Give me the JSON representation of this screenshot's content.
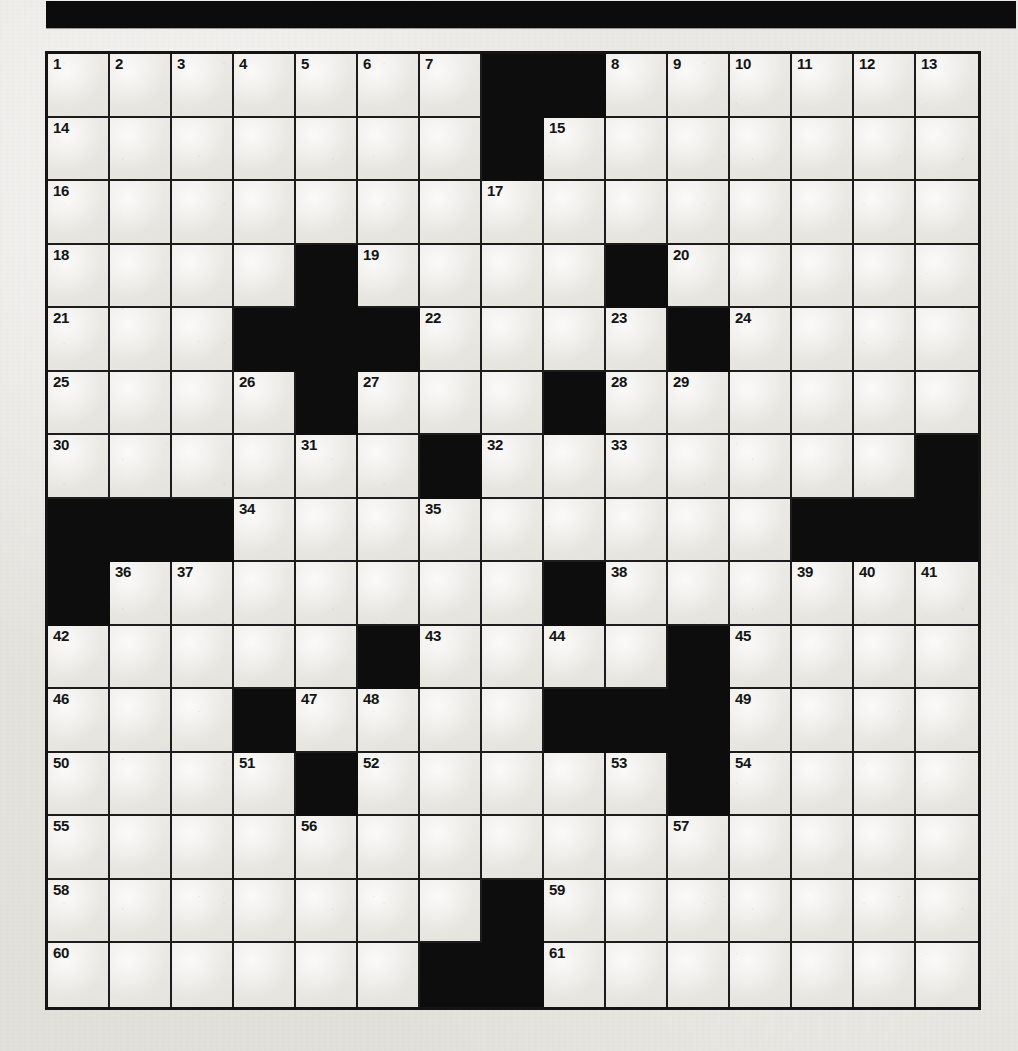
{
  "masthead": {
    "title": "",
    "color": "#0c0c0c"
  },
  "puzzle": {
    "name": "Crossword Puzzle",
    "rows": 15,
    "columns": 15,
    "cell_colors": {
      "white": "#eae8e3",
      "black": "#0d0d0d",
      "grid_line": "#1c1c1c",
      "number": "#141414"
    },
    "total_clue_numbers": 61,
    "grid": [
      [
        {
          "type": "white",
          "number": "1"
        },
        {
          "type": "white",
          "number": "2"
        },
        {
          "type": "white",
          "number": "3"
        },
        {
          "type": "white",
          "number": "4"
        },
        {
          "type": "white",
          "number": "5"
        },
        {
          "type": "white",
          "number": "6"
        },
        {
          "type": "white",
          "number": "7"
        },
        {
          "type": "black",
          "number": ""
        },
        {
          "type": "black",
          "number": ""
        },
        {
          "type": "white",
          "number": "8"
        },
        {
          "type": "white",
          "number": "9"
        },
        {
          "type": "white",
          "number": "10"
        },
        {
          "type": "white",
          "number": "11"
        },
        {
          "type": "white",
          "number": "12"
        },
        {
          "type": "white",
          "number": "13"
        }
      ],
      [
        {
          "type": "white",
          "number": "14"
        },
        {
          "type": "white",
          "number": ""
        },
        {
          "type": "white",
          "number": ""
        },
        {
          "type": "white",
          "number": ""
        },
        {
          "type": "white",
          "number": ""
        },
        {
          "type": "white",
          "number": ""
        },
        {
          "type": "white",
          "number": ""
        },
        {
          "type": "black",
          "number": ""
        },
        {
          "type": "white",
          "number": "15"
        },
        {
          "type": "white",
          "number": ""
        },
        {
          "type": "white",
          "number": ""
        },
        {
          "type": "white",
          "number": ""
        },
        {
          "type": "white",
          "number": ""
        },
        {
          "type": "white",
          "number": ""
        },
        {
          "type": "white",
          "number": ""
        }
      ],
      [
        {
          "type": "white",
          "number": "16"
        },
        {
          "type": "white",
          "number": ""
        },
        {
          "type": "white",
          "number": ""
        },
        {
          "type": "white",
          "number": ""
        },
        {
          "type": "white",
          "number": ""
        },
        {
          "type": "white",
          "number": ""
        },
        {
          "type": "white",
          "number": ""
        },
        {
          "type": "white",
          "number": "17"
        },
        {
          "type": "white",
          "number": ""
        },
        {
          "type": "white",
          "number": ""
        },
        {
          "type": "white",
          "number": ""
        },
        {
          "type": "white",
          "number": ""
        },
        {
          "type": "white",
          "number": ""
        },
        {
          "type": "white",
          "number": ""
        },
        {
          "type": "white",
          "number": ""
        }
      ],
      [
        {
          "type": "white",
          "number": "18"
        },
        {
          "type": "white",
          "number": ""
        },
        {
          "type": "white",
          "number": ""
        },
        {
          "type": "white",
          "number": ""
        },
        {
          "type": "black",
          "number": ""
        },
        {
          "type": "white",
          "number": "19"
        },
        {
          "type": "white",
          "number": ""
        },
        {
          "type": "white",
          "number": ""
        },
        {
          "type": "white",
          "number": ""
        },
        {
          "type": "black",
          "number": ""
        },
        {
          "type": "white",
          "number": "20"
        },
        {
          "type": "white",
          "number": ""
        },
        {
          "type": "white",
          "number": ""
        },
        {
          "type": "white",
          "number": ""
        },
        {
          "type": "white",
          "number": ""
        }
      ],
      [
        {
          "type": "white",
          "number": "21"
        },
        {
          "type": "white",
          "number": ""
        },
        {
          "type": "white",
          "number": ""
        },
        {
          "type": "black",
          "number": ""
        },
        {
          "type": "black",
          "number": ""
        },
        {
          "type": "black",
          "number": ""
        },
        {
          "type": "white",
          "number": "22"
        },
        {
          "type": "white",
          "number": ""
        },
        {
          "type": "white",
          "number": ""
        },
        {
          "type": "white",
          "number": "23"
        },
        {
          "type": "black",
          "number": ""
        },
        {
          "type": "white",
          "number": "24"
        },
        {
          "type": "white",
          "number": ""
        },
        {
          "type": "white",
          "number": ""
        },
        {
          "type": "white",
          "number": ""
        }
      ],
      [
        {
          "type": "white",
          "number": "25"
        },
        {
          "type": "white",
          "number": ""
        },
        {
          "type": "white",
          "number": ""
        },
        {
          "type": "white",
          "number": "26"
        },
        {
          "type": "black",
          "number": ""
        },
        {
          "type": "white",
          "number": "27"
        },
        {
          "type": "white",
          "number": ""
        },
        {
          "type": "white",
          "number": ""
        },
        {
          "type": "black",
          "number": ""
        },
        {
          "type": "white",
          "number": "28"
        },
        {
          "type": "white",
          "number": "29"
        },
        {
          "type": "white",
          "number": ""
        },
        {
          "type": "white",
          "number": ""
        },
        {
          "type": "white",
          "number": ""
        },
        {
          "type": "white",
          "number": ""
        }
      ],
      [
        {
          "type": "white",
          "number": "30"
        },
        {
          "type": "white",
          "number": ""
        },
        {
          "type": "white",
          "number": ""
        },
        {
          "type": "white",
          "number": ""
        },
        {
          "type": "white",
          "number": "31"
        },
        {
          "type": "white",
          "number": ""
        },
        {
          "type": "black",
          "number": ""
        },
        {
          "type": "white",
          "number": "32"
        },
        {
          "type": "white",
          "number": ""
        },
        {
          "type": "white",
          "number": "33"
        },
        {
          "type": "white",
          "number": ""
        },
        {
          "type": "white",
          "number": ""
        },
        {
          "type": "white",
          "number": ""
        },
        {
          "type": "white",
          "number": ""
        },
        {
          "type": "black",
          "number": ""
        }
      ],
      [
        {
          "type": "black",
          "number": ""
        },
        {
          "type": "black",
          "number": ""
        },
        {
          "type": "black",
          "number": ""
        },
        {
          "type": "white",
          "number": "34"
        },
        {
          "type": "white",
          "number": ""
        },
        {
          "type": "white",
          "number": ""
        },
        {
          "type": "white",
          "number": "35"
        },
        {
          "type": "white",
          "number": ""
        },
        {
          "type": "white",
          "number": ""
        },
        {
          "type": "white",
          "number": ""
        },
        {
          "type": "white",
          "number": ""
        },
        {
          "type": "white",
          "number": ""
        },
        {
          "type": "black",
          "number": ""
        },
        {
          "type": "black",
          "number": ""
        },
        {
          "type": "black",
          "number": ""
        }
      ],
      [
        {
          "type": "black",
          "number": ""
        },
        {
          "type": "white",
          "number": "36"
        },
        {
          "type": "white",
          "number": "37"
        },
        {
          "type": "white",
          "number": ""
        },
        {
          "type": "white",
          "number": ""
        },
        {
          "type": "white",
          "number": ""
        },
        {
          "type": "white",
          "number": ""
        },
        {
          "type": "white",
          "number": ""
        },
        {
          "type": "black",
          "number": ""
        },
        {
          "type": "white",
          "number": "38"
        },
        {
          "type": "white",
          "number": ""
        },
        {
          "type": "white",
          "number": ""
        },
        {
          "type": "white",
          "number": "39"
        },
        {
          "type": "white",
          "number": "40"
        },
        {
          "type": "white",
          "number": "41"
        }
      ],
      [
        {
          "type": "white",
          "number": "42"
        },
        {
          "type": "white",
          "number": ""
        },
        {
          "type": "white",
          "number": ""
        },
        {
          "type": "white",
          "number": ""
        },
        {
          "type": "white",
          "number": ""
        },
        {
          "type": "black",
          "number": ""
        },
        {
          "type": "white",
          "number": "43"
        },
        {
          "type": "white",
          "number": ""
        },
        {
          "type": "white",
          "number": "44"
        },
        {
          "type": "white",
          "number": ""
        },
        {
          "type": "black",
          "number": ""
        },
        {
          "type": "white",
          "number": "45"
        },
        {
          "type": "white",
          "number": ""
        },
        {
          "type": "white",
          "number": ""
        },
        {
          "type": "white",
          "number": ""
        }
      ],
      [
        {
          "type": "white",
          "number": "46"
        },
        {
          "type": "white",
          "number": ""
        },
        {
          "type": "white",
          "number": ""
        },
        {
          "type": "black",
          "number": ""
        },
        {
          "type": "white",
          "number": "47"
        },
        {
          "type": "white",
          "number": "48"
        },
        {
          "type": "white",
          "number": ""
        },
        {
          "type": "white",
          "number": ""
        },
        {
          "type": "black",
          "number": ""
        },
        {
          "type": "black",
          "number": ""
        },
        {
          "type": "black",
          "number": ""
        },
        {
          "type": "white",
          "number": "49"
        },
        {
          "type": "white",
          "number": ""
        },
        {
          "type": "white",
          "number": ""
        },
        {
          "type": "white",
          "number": ""
        }
      ],
      [
        {
          "type": "white",
          "number": "50"
        },
        {
          "type": "white",
          "number": ""
        },
        {
          "type": "white",
          "number": ""
        },
        {
          "type": "white",
          "number": "51"
        },
        {
          "type": "black",
          "number": ""
        },
        {
          "type": "white",
          "number": "52"
        },
        {
          "type": "white",
          "number": ""
        },
        {
          "type": "white",
          "number": ""
        },
        {
          "type": "white",
          "number": ""
        },
        {
          "type": "white",
          "number": "53"
        },
        {
          "type": "black",
          "number": ""
        },
        {
          "type": "white",
          "number": "54"
        },
        {
          "type": "white",
          "number": ""
        },
        {
          "type": "white",
          "number": ""
        },
        {
          "type": "white",
          "number": ""
        }
      ],
      [
        {
          "type": "white",
          "number": "55"
        },
        {
          "type": "white",
          "number": ""
        },
        {
          "type": "white",
          "number": ""
        },
        {
          "type": "white",
          "number": ""
        },
        {
          "type": "white",
          "number": "56"
        },
        {
          "type": "white",
          "number": ""
        },
        {
          "type": "white",
          "number": ""
        },
        {
          "type": "white",
          "number": ""
        },
        {
          "type": "white",
          "number": ""
        },
        {
          "type": "white",
          "number": ""
        },
        {
          "type": "white",
          "number": "57"
        },
        {
          "type": "white",
          "number": ""
        },
        {
          "type": "white",
          "number": ""
        },
        {
          "type": "white",
          "number": ""
        },
        {
          "type": "white",
          "number": ""
        }
      ],
      [
        {
          "type": "white",
          "number": "58"
        },
        {
          "type": "white",
          "number": ""
        },
        {
          "type": "white",
          "number": ""
        },
        {
          "type": "white",
          "number": ""
        },
        {
          "type": "white",
          "number": ""
        },
        {
          "type": "white",
          "number": ""
        },
        {
          "type": "white",
          "number": ""
        },
        {
          "type": "black",
          "number": ""
        },
        {
          "type": "white",
          "number": "59"
        },
        {
          "type": "white",
          "number": ""
        },
        {
          "type": "white",
          "number": ""
        },
        {
          "type": "white",
          "number": ""
        },
        {
          "type": "white",
          "number": ""
        },
        {
          "type": "white",
          "number": ""
        },
        {
          "type": "white",
          "number": ""
        }
      ],
      [
        {
          "type": "white",
          "number": "60"
        },
        {
          "type": "white",
          "number": ""
        },
        {
          "type": "white",
          "number": ""
        },
        {
          "type": "white",
          "number": ""
        },
        {
          "type": "white",
          "number": ""
        },
        {
          "type": "white",
          "number": ""
        },
        {
          "type": "black",
          "number": ""
        },
        {
          "type": "black",
          "number": ""
        },
        {
          "type": "white",
          "number": "61"
        },
        {
          "type": "white",
          "number": ""
        },
        {
          "type": "white",
          "number": ""
        },
        {
          "type": "white",
          "number": ""
        },
        {
          "type": "white",
          "number": ""
        },
        {
          "type": "white",
          "number": ""
        },
        {
          "type": "white",
          "number": ""
        }
      ]
    ]
  }
}
